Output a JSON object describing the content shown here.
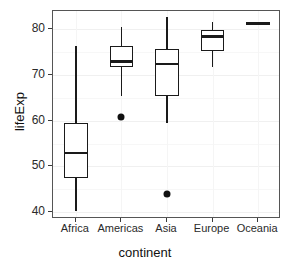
{
  "chart_data": {
    "type": "box",
    "title": "",
    "xlabel": "continent",
    "ylabel": "lifeExp",
    "categories": [
      "Africa",
      "Americas",
      "Asia",
      "Europe",
      "Oceania"
    ],
    "ylim": [
      38.5,
      84.0
    ],
    "yticks": [
      40,
      50,
      60,
      70,
      80
    ],
    "ytick_labels": [
      "40",
      "50",
      "60",
      "70",
      "80"
    ],
    "grid": true,
    "legend": "none",
    "boxes": [
      {
        "category": "Africa",
        "whisker_low": 40.2,
        "q1": 47.5,
        "median": 52.9,
        "q3": 59.6,
        "whisker_high": 76.4,
        "outliers": []
      },
      {
        "category": "Americas",
        "whisker_low": 65.3,
        "q1": 71.8,
        "median": 72.9,
        "q3": 76.4,
        "whisker_high": 80.6,
        "outliers": [
          60.9
        ]
      },
      {
        "category": "Asia",
        "whisker_low": 59.5,
        "q1": 65.4,
        "median": 72.4,
        "q3": 75.6,
        "whisker_high": 82.6,
        "outliers": [
          44.0
        ]
      },
      {
        "category": "Europe",
        "whisker_low": 71.8,
        "q1": 75.3,
        "median": 78.4,
        "q3": 79.8,
        "whisker_high": 81.7,
        "outliers": []
      },
      {
        "category": "Oceania",
        "whisker_low": 81.2,
        "q1": 81.2,
        "median": 81.2,
        "q3": 81.2,
        "whisker_high": 81.2,
        "outliers": []
      }
    ]
  }
}
